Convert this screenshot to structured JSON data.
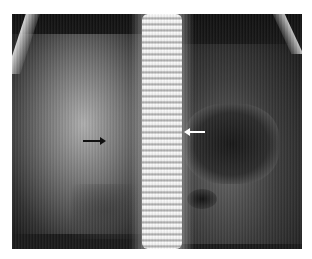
{
  "image": {
    "type": "abdominal-radiograph",
    "description": "Frontal abdominal X-ray with lumbar spine centered, gas-filled bowel loops",
    "colors": {
      "background": "#ffffff",
      "film_dark": "#1a1a1a"
    }
  },
  "annotations": [
    {
      "name": "black-arrow",
      "direction": "right",
      "color": "#111111"
    },
    {
      "name": "white-arrow",
      "direction": "left",
      "color": "#ffffff"
    }
  ]
}
